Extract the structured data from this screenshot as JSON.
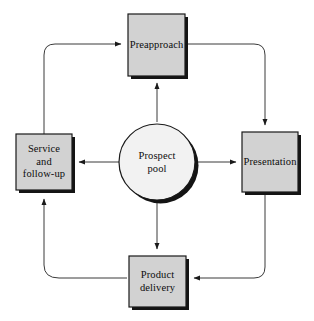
{
  "diagram": {
    "type": "cycle-flow-diagram",
    "colors": {
      "background": "#ffffff",
      "box_fill": "#d2d2d2",
      "circle_fill": "#f2f2f2",
      "stroke": "#1a1a1a",
      "shadow": "#111111",
      "text": "#0c0c0c"
    },
    "center": {
      "id": "prospect-pool",
      "label": "Prospect\npool",
      "shape": "circle"
    },
    "nodes": [
      {
        "id": "preapproach",
        "label": "Preapproach",
        "shape": "rectangle",
        "position": "top"
      },
      {
        "id": "presentation",
        "label": "Presentation",
        "shape": "rectangle",
        "position": "right"
      },
      {
        "id": "product-delivery",
        "label": "Product\ndelivery",
        "shape": "rectangle",
        "position": "bottom"
      },
      {
        "id": "service-and-follow-up",
        "label": "Service\nand\nfollow-up",
        "shape": "rectangle",
        "position": "left"
      }
    ],
    "connectors": [
      {
        "id": "pool-to-preapproach",
        "from": "prospect-pool",
        "to": "preapproach",
        "style": "straight-arrow",
        "direction": "up"
      },
      {
        "id": "pool-to-presentation",
        "from": "prospect-pool",
        "to": "presentation",
        "style": "straight-arrow",
        "direction": "right"
      },
      {
        "id": "pool-to-product-delivery",
        "from": "prospect-pool",
        "to": "product-delivery",
        "style": "straight-arrow",
        "direction": "down"
      },
      {
        "id": "pool-to-service",
        "from": "prospect-pool",
        "to": "service-and-follow-up",
        "style": "straight-arrow",
        "direction": "left"
      },
      {
        "id": "preapproach-to-presentation",
        "from": "preapproach",
        "to": "presentation",
        "style": "rounded-elbow-arrow",
        "direction": "clockwise"
      },
      {
        "id": "presentation-to-product-delivery",
        "from": "presentation",
        "to": "product-delivery",
        "style": "rounded-elbow-arrow",
        "direction": "clockwise"
      },
      {
        "id": "product-delivery-to-service",
        "from": "product-delivery",
        "to": "service-and-follow-up",
        "style": "rounded-elbow-arrow",
        "direction": "clockwise"
      },
      {
        "id": "service-to-preapproach",
        "from": "service-and-follow-up",
        "to": "preapproach",
        "style": "rounded-elbow-arrow",
        "direction": "clockwise"
      }
    ]
  }
}
